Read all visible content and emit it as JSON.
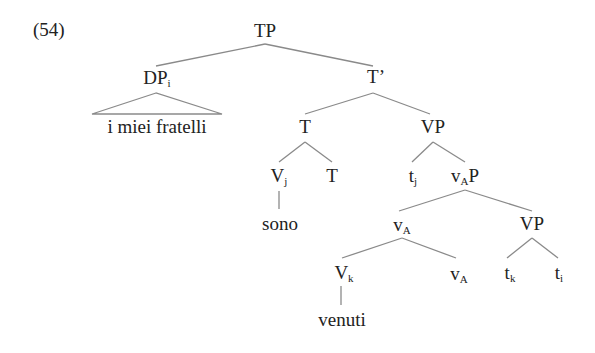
{
  "example": {
    "number": "(54)"
  },
  "colors": {
    "text": "#222222",
    "branch": "#8a8a8a",
    "background": "#ffffff"
  },
  "tree": {
    "nodes": {
      "tp": {
        "label": "TP"
      },
      "dp": {
        "label": "DP",
        "subscript": "i"
      },
      "dp_terminal": {
        "label": "i miei fratelli"
      },
      "t_bar": {
        "label": "T’"
      },
      "t_head": {
        "label": "T"
      },
      "vp_upper": {
        "label": "VP"
      },
      "v_j": {
        "label": "V",
        "subscript": "j"
      },
      "t_lower": {
        "label": "T"
      },
      "t_j": {
        "label": "t",
        "subscript": "j"
      },
      "vap": {
        "label_main": "v",
        "subscript": "A",
        "label_tail": "P"
      },
      "sono": {
        "label": "sono"
      },
      "va_bar": {
        "label": "v",
        "subscript": "A"
      },
      "vp_lower": {
        "label": "VP"
      },
      "v_k": {
        "label": "V",
        "subscript": "k"
      },
      "va_head": {
        "label": "v",
        "subscript": "A"
      },
      "t_k": {
        "label": "t",
        "subscript": "k"
      },
      "t_i": {
        "label": "t",
        "subscript": "i"
      },
      "venuti": {
        "label": "venuti"
      }
    },
    "structure": [
      {
        "parent": "TP",
        "children": [
          "DP_i",
          "T’"
        ]
      },
      {
        "parent": "DP_i",
        "children": [
          "i miei fratelli"
        ],
        "style": "triangle"
      },
      {
        "parent": "T’",
        "children": [
          "T",
          "VP"
        ]
      },
      {
        "parent": "T",
        "children": [
          "V_j",
          "T"
        ]
      },
      {
        "parent": "V_j",
        "children": [
          "sono"
        ]
      },
      {
        "parent": "VP",
        "children": [
          "t_j",
          "v_A P"
        ]
      },
      {
        "parent": "v_A P",
        "children": [
          "v_A",
          "VP"
        ]
      },
      {
        "parent": "v_A",
        "children": [
          "V_k",
          "v_A"
        ]
      },
      {
        "parent": "V_k",
        "children": [
          "venuti"
        ]
      },
      {
        "parent": "VP",
        "children": [
          "t_k",
          "t_i"
        ]
      }
    ]
  }
}
